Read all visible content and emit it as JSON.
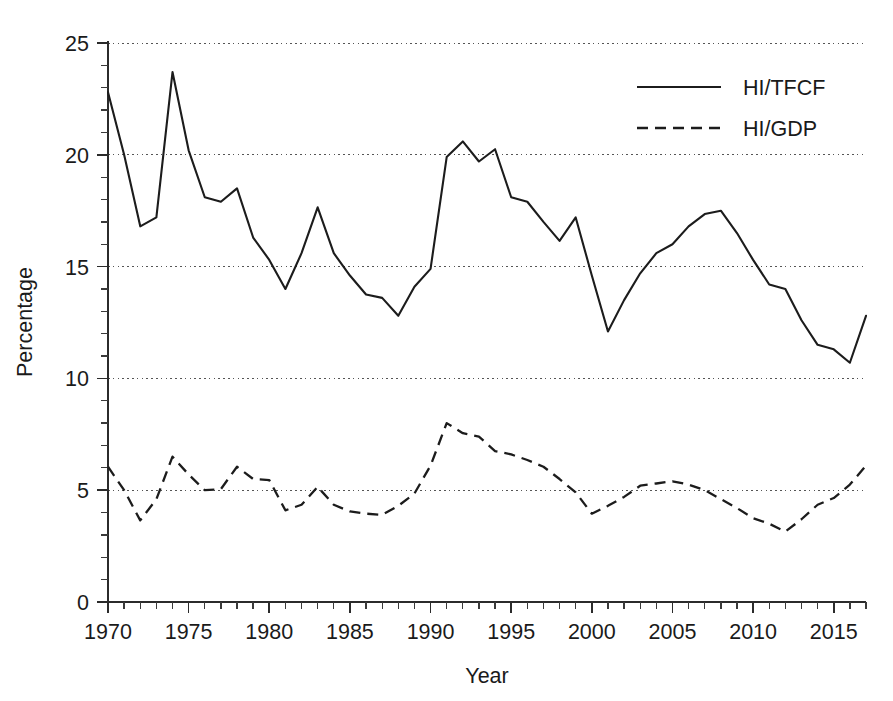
{
  "chart_data": {
    "type": "line",
    "title": "",
    "xlabel": "Year",
    "ylabel": "Percentage",
    "xlim": [
      1970,
      2017
    ],
    "ylim": [
      0,
      25
    ],
    "grid": true,
    "gridlines_y": [
      5,
      10,
      15,
      20,
      25
    ],
    "legend_position": "top-right",
    "x_ticks_major": [
      1970,
      1975,
      1980,
      1985,
      1990,
      1995,
      2000,
      2005,
      2010,
      2015
    ],
    "x_tick_labels": [
      "1970",
      "1975",
      "1980",
      "1985",
      "1990",
      "1995",
      "2000",
      "2005",
      "2010",
      "2015"
    ],
    "x_tick_minor_step": 1,
    "y_ticks_major": [
      0,
      5,
      10,
      15,
      20,
      25
    ],
    "y_tick_labels": [
      "0",
      "5",
      "10",
      "15",
      "20",
      "25"
    ],
    "y_tick_minor_step": 1,
    "x": [
      1970,
      1971,
      1972,
      1973,
      1974,
      1975,
      1976,
      1977,
      1978,
      1979,
      1980,
      1981,
      1982,
      1983,
      1984,
      1985,
      1986,
      1987,
      1988,
      1989,
      1990,
      1991,
      1992,
      1993,
      1994,
      1995,
      1996,
      1997,
      1998,
      1999,
      2000,
      2001,
      2002,
      2003,
      2004,
      2005,
      2006,
      2007,
      2008,
      2009,
      2010,
      2011,
      2012,
      2013,
      2014,
      2015,
      2016,
      2017
    ],
    "series": [
      {
        "name": "HI/TFCF",
        "style": "solid",
        "color": "#1c1c1c",
        "values": [
          22.8,
          20.0,
          16.8,
          17.2,
          23.7,
          20.2,
          18.1,
          17.9,
          18.5,
          16.3,
          15.3,
          14.0,
          15.6,
          17.65,
          15.6,
          14.6,
          13.75,
          13.6,
          12.8,
          14.1,
          14.9,
          19.9,
          20.6,
          19.7,
          20.25,
          18.1,
          17.9,
          17.0,
          16.15,
          17.2,
          14.6,
          12.1,
          13.5,
          14.7,
          15.6,
          16.0,
          16.8,
          17.35,
          17.5,
          16.5,
          15.3,
          14.2,
          14.0,
          12.6,
          11.5,
          11.3,
          10.7,
          12.8
        ]
      },
      {
        "name": "HI/GDP",
        "style": "dashed",
        "color": "#1c1c1c",
        "values": [
          6.05,
          5.0,
          3.65,
          4.6,
          6.5,
          5.7,
          5.0,
          5.05,
          6.05,
          5.5,
          5.45,
          4.1,
          4.35,
          5.15,
          4.35,
          4.05,
          3.95,
          3.9,
          4.3,
          4.85,
          6.1,
          8.0,
          7.55,
          7.4,
          6.75,
          6.6,
          6.35,
          6.05,
          5.5,
          4.9,
          3.95,
          4.3,
          4.7,
          5.2,
          5.3,
          5.4,
          5.25,
          5.0,
          4.6,
          4.2,
          3.75,
          3.5,
          3.15,
          3.7,
          4.35,
          4.65,
          5.25,
          6.1
        ]
      }
    ],
    "series_values_by_year_note": ""
  },
  "legend": {
    "entries": [
      {
        "label": "HI/TFCF",
        "style": "solid"
      },
      {
        "label": "HI/GDP",
        "style": "dashed"
      }
    ]
  },
  "axes": {
    "x_title": "Year",
    "y_title": "Percentage"
  }
}
